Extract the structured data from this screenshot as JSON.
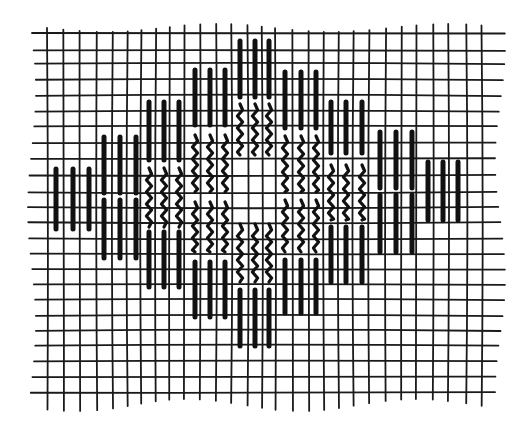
{
  "figure": {
    "description": "Bargello / Florentine needlework stitch diagram on canvas grid: diamond motif of vertical straight stitches (solid outer bands, wavy inner bands)",
    "colors": {
      "ink": "#111111",
      "grid": "#1a1a1a",
      "background": "#ffffff"
    }
  },
  "grid": {
    "vertical_lines_x": [
      47,
      63,
      79,
      96,
      112,
      127,
      141,
      156,
      170,
      185,
      201,
      217,
      232,
      248,
      262,
      275,
      292,
      308,
      323,
      338,
      353,
      369,
      386,
      402,
      417,
      434,
      449,
      467,
      482
    ],
    "horizontal_lines_y": [
      33,
      50,
      63,
      79,
      95,
      111,
      126,
      143,
      159,
      176,
      193,
      208,
      223,
      239,
      254,
      269,
      284,
      299,
      315,
      330,
      345,
      361,
      377,
      393
    ],
    "x_start": 32,
    "x_end": 500,
    "y_start": 28,
    "y_end": 405
  },
  "stitch_groups": [
    {
      "name": "A",
      "columns_x": [
        56,
        73,
        89
      ],
      "segments": [
        {
          "type": "solid",
          "y1": 169,
          "y2": 229
        }
      ]
    },
    {
      "name": "B",
      "columns_x": [
        104,
        120,
        136
      ],
      "segments": [
        {
          "type": "solid",
          "y1": 137,
          "y2": 193
        },
        {
          "type": "solid",
          "y1": 200,
          "y2": 258
        }
      ]
    },
    {
      "name": "C",
      "columns_x": [
        149,
        164,
        179
      ],
      "segments": [
        {
          "type": "solid",
          "y1": 102,
          "y2": 160
        },
        {
          "type": "wavy",
          "y1": 168,
          "y2": 227
        },
        {
          "type": "solid",
          "y1": 232,
          "y2": 287
        }
      ]
    },
    {
      "name": "D",
      "columns_x": [
        195,
        210,
        225
      ],
      "segments": [
        {
          "type": "solid",
          "y1": 70,
          "y2": 125
        },
        {
          "type": "wavy",
          "y1": 135,
          "y2": 192
        },
        {
          "type": "wavy",
          "y1": 202,
          "y2": 252
        },
        {
          "type": "solid",
          "y1": 262,
          "y2": 317
        }
      ]
    },
    {
      "name": "E",
      "columns_x": [
        240,
        255,
        269
      ],
      "segments": [
        {
          "type": "solid",
          "y1": 41,
          "y2": 97
        },
        {
          "type": "wavy",
          "y1": 104,
          "y2": 155
        },
        {
          "type": "wavy",
          "y1": 224,
          "y2": 282
        },
        {
          "type": "solid",
          "y1": 290,
          "y2": 346
        }
      ]
    },
    {
      "name": "F",
      "columns_x": [
        285,
        301,
        316
      ],
      "segments": [
        {
          "type": "solid",
          "y1": 72,
          "y2": 128
        },
        {
          "type": "wavy",
          "y1": 136,
          "y2": 192
        },
        {
          "type": "wavy",
          "y1": 200,
          "y2": 252
        },
        {
          "type": "solid",
          "y1": 260,
          "y2": 313
        }
      ]
    },
    {
      "name": "G",
      "columns_x": [
        331,
        346,
        362
      ],
      "segments": [
        {
          "type": "solid",
          "y1": 102,
          "y2": 153
        },
        {
          "type": "wavy",
          "y1": 165,
          "y2": 220
        },
        {
          "type": "solid",
          "y1": 227,
          "y2": 282
        }
      ]
    },
    {
      "name": "H",
      "columns_x": [
        380,
        396,
        412
      ],
      "segments": [
        {
          "type": "solid",
          "y1": 132,
          "y2": 188
        },
        {
          "type": "solid",
          "y1": 195,
          "y2": 252
        }
      ]
    },
    {
      "name": "I",
      "columns_x": [
        428,
        443,
        458
      ],
      "segments": [
        {
          "type": "solid",
          "y1": 162,
          "y2": 220
        }
      ]
    }
  ],
  "legend": {
    "solid_label": "straight stitch",
    "wavy_label": "contrast-thread straight stitch"
  }
}
